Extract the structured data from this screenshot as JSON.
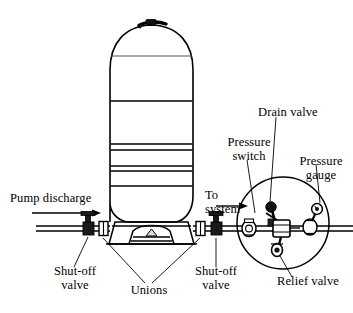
{
  "figure": {
    "background_color": "#ffffff",
    "line_color": "#000000",
    "width": 353,
    "height": 313
  },
  "labels": {
    "pump_discharge": "Pump discharge",
    "to_system": "To\nsystem",
    "shutoff_valve_left": "Shut-off\nvalve",
    "shutoff_valve_right": "Shut-off\nvalve",
    "unions": "Unions",
    "drain_valve": "Drain valve",
    "pressure_switch": "Pressure\nswitch",
    "pressure_gauge": "Pressure\ngauge",
    "relief_valve": "Relief valve"
  },
  "components": {
    "tank": {
      "name": "pressure-tank",
      "description": "Vertical domed pressure tank with horizontal seam bands and support skirt"
    },
    "detail_circle": {
      "name": "detail-callout-circle",
      "center_x": 283,
      "center_y": 223,
      "radius": 46
    },
    "flow_arrows": [
      {
        "name": "pump-discharge-flow-arrow",
        "direction": "right"
      },
      {
        "name": "to-system-flow-arrow",
        "direction": "right"
      }
    ]
  }
}
